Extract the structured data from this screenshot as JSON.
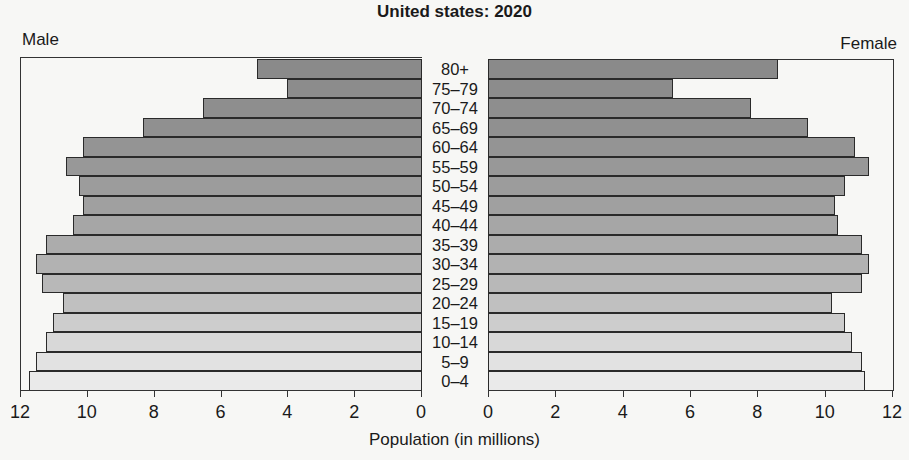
{
  "chart_data": {
    "type": "bar",
    "subtype": "population-pyramid",
    "title": "United states: 2020",
    "xlabel": "Population (in millions)",
    "ylabel": "",
    "left_label": "Male",
    "right_label": "Female",
    "categories": [
      "80+",
      "75–79",
      "70–74",
      "65–69",
      "60–64",
      "55–59",
      "50–54",
      "45–49",
      "40–44",
      "35–39",
      "30–34",
      "25–29",
      "20–24",
      "15–19",
      "10–14",
      "5–9",
      "0–4"
    ],
    "series": [
      {
        "name": "Male",
        "values": [
          4.9,
          4.0,
          6.5,
          8.3,
          10.1,
          10.6,
          10.2,
          10.1,
          10.4,
          11.2,
          11.5,
          11.3,
          10.7,
          11.0,
          11.2,
          11.5,
          11.7
        ]
      },
      {
        "name": "Female",
        "values": [
          8.6,
          5.5,
          7.8,
          9.5,
          10.9,
          11.3,
          10.6,
          10.3,
          10.4,
          11.1,
          11.3,
          11.1,
          10.2,
          10.6,
          10.8,
          11.1,
          11.2
        ]
      }
    ],
    "xlim": [
      0,
      12
    ],
    "x_ticks_male": [
      "12",
      "10",
      "8",
      "6",
      "4",
      "2",
      "0"
    ],
    "x_ticks_female": [
      "0",
      "2",
      "4",
      "6",
      "8",
      "10",
      "12"
    ],
    "grid": false,
    "legend": "none",
    "bar_colors": [
      "#8a8a8a",
      "#8c8c8c",
      "#8e8e8e",
      "#909090",
      "#949494",
      "#989898",
      "#9c9c9c",
      "#a0a0a0",
      "#a6a6a6",
      "#acacac",
      "#b2b2b2",
      "#b8b8b8",
      "#c0c0c0",
      "#cdcdcd",
      "#d8d8d8",
      "#e2e2e2",
      "#eaeaea"
    ]
  }
}
